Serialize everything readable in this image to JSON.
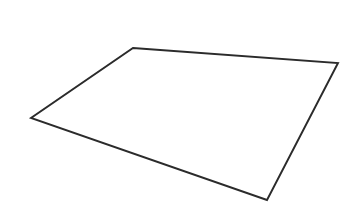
{
  "canvas": {
    "width": 355,
    "height": 217,
    "background_color": "#ffffff",
    "title": "Quadrilateral Outline"
  },
  "shape": {
    "name": "quadrilateral",
    "type": "polygon",
    "sides": 4,
    "fill": "none",
    "fill_color": "#ffffff",
    "stroke_color": "#2b2b2b",
    "stroke_width": 1.9,
    "closed": true,
    "vertices": [
      {
        "label": "top-left-apex",
        "x": 133,
        "y": 48
      },
      {
        "label": "right",
        "x": 338,
        "y": 63
      },
      {
        "label": "bottom",
        "x": 267,
        "y": 200
      },
      {
        "label": "left",
        "x": 31,
        "y": 118
      }
    ],
    "points_string": "133,48 338,63 267,200 31,118",
    "edges": [
      {
        "name": "top-edge",
        "from": "top-left-apex",
        "to": "right"
      },
      {
        "name": "right-edge",
        "from": "right",
        "to": "bottom"
      },
      {
        "name": "bottom-edge",
        "from": "bottom",
        "to": "left"
      },
      {
        "name": "left-edge",
        "from": "left",
        "to": "top-left-apex"
      }
    ]
  }
}
